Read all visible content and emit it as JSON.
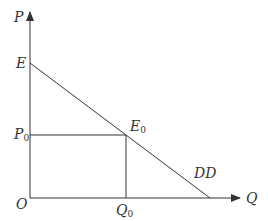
{
  "diagram": {
    "type": "supply-demand",
    "axes": {
      "y_label": "P",
      "x_label": "Q",
      "origin_label": "O"
    },
    "points": {
      "intercept": {
        "label": "E"
      },
      "equilibrium": {
        "label": "E",
        "subscript": "0"
      },
      "price": {
        "label": "P",
        "subscript": "0"
      },
      "quantity": {
        "label": "Q",
        "subscript": "0"
      }
    },
    "curve_label": "DD",
    "colors": {
      "line": "#333333",
      "text": "#333333"
    }
  }
}
